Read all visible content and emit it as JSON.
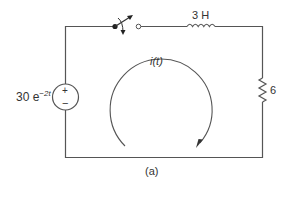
{
  "figure": {
    "caption": "(a)"
  },
  "source": {
    "type": "voltage-source",
    "label_base": "30 e",
    "label_exponent": "−2t",
    "plus": "+",
    "minus": "−"
  },
  "switch": {
    "type": "switch",
    "state": "open"
  },
  "inductor": {
    "type": "inductor",
    "label": "3 H"
  },
  "resistor": {
    "type": "resistor",
    "label": "6"
  },
  "current": {
    "label": "i(t)",
    "direction": "clockwise"
  },
  "colors": {
    "wire": "#555555",
    "text": "#333333",
    "background": "#ffffff"
  }
}
